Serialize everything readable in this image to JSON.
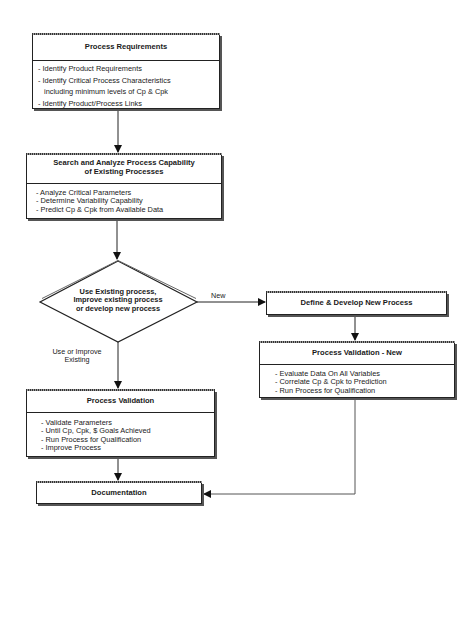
{
  "nodes": {
    "requirements": {
      "title": "Process Requirements",
      "items": [
        "- Identify Product Requirements",
        "- Identify Critical Process Characteristics",
        "  including minimum levels of Cp & Cpk",
        "- Identify Product/Process Links"
      ]
    },
    "search": {
      "title_line1": "Search and Analyze Process Capability",
      "title_line2": "of Existing Processes",
      "items": [
        "- Analyze  Critical Parameters",
        "- Determine Variability Capability",
        "- Predict Cp & Cpk from Available Data"
      ]
    },
    "decision": {
      "line1": "Use Existing process,",
      "line2": "Improve existing process",
      "line3": "or develop new process"
    },
    "define_new": {
      "title": "Define & Develop New Process"
    },
    "validation_new": {
      "title": "Process Validation - New",
      "items": [
        "- Evaluate Data On All Variables",
        "- Correlate Cp & Cpk to Prediction",
        "- Run Process for Qualification"
      ]
    },
    "validation": {
      "title": "Process Validation",
      "items": [
        "- Validate Parameters",
        "- Until Cp, Cpk, $ Goals Achieved",
        "- Run Process for Qualification",
        "- Improve Process"
      ]
    },
    "documentation": {
      "title": "Documentation"
    }
  },
  "edges": {
    "new_label": "New",
    "existing_label_line1": "Use or Improve",
    "existing_label_line2": "Existing"
  },
  "colors": {
    "line": "#222222",
    "background": "#ffffff"
  }
}
